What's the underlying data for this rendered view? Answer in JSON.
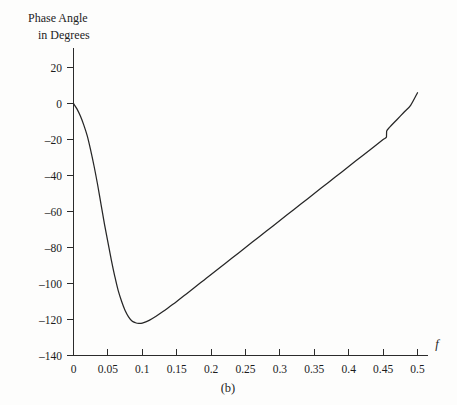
{
  "figure": {
    "caption": "(b)",
    "background_color": "#fdfdfc",
    "curve_color": "#262626",
    "axis_color": "#2b2b2b"
  },
  "axes": {
    "y_label_line1": "Phase Angle",
    "y_label_line2": "in Degrees",
    "x_label": "f",
    "x_ticks": [
      "0",
      "0.05",
      "0.1",
      "0.15",
      "0.2",
      "0.25",
      "0.3",
      "0.35",
      "0.4",
      "0.45",
      "0.5"
    ],
    "x_tick_values": [
      0,
      0.05,
      0.1,
      0.15,
      0.2,
      0.25,
      0.3,
      0.35,
      0.4,
      0.45,
      0.5
    ],
    "y_ticks": [
      "20",
      "0",
      "–20",
      "–40",
      "–60",
      "–80",
      "–100",
      "–120",
      "–140"
    ],
    "y_tick_values": [
      20,
      0,
      -20,
      -40,
      -60,
      -80,
      -100,
      -120,
      -140
    ]
  },
  "chart_data": {
    "type": "line",
    "title": "",
    "subtitle": "",
    "caption": "(b)",
    "xlabel": "f",
    "ylabel": "Phase Angle in Degrees",
    "xlim": [
      0,
      0.5
    ],
    "ylim": [
      -140,
      20
    ],
    "xticks": [
      0,
      0.05,
      0.1,
      0.15,
      0.2,
      0.25,
      0.3,
      0.35,
      0.4,
      0.45,
      0.5
    ],
    "yticks": [
      20,
      0,
      -20,
      -40,
      -60,
      -80,
      -100,
      -120,
      -140
    ],
    "grid": false,
    "legend": "none",
    "annotations": [
      "small discontinuity near f = 0.455"
    ],
    "series": [
      {
        "name": "Phase Angle",
        "color": "#262626",
        "x": [
          0,
          0.005,
          0.01,
          0.015,
          0.02,
          0.025,
          0.03,
          0.035,
          0.04,
          0.045,
          0.05,
          0.055,
          0.06,
          0.065,
          0.07,
          0.075,
          0.08,
          0.085,
          0.09,
          0.095,
          0.1,
          0.11,
          0.12,
          0.13,
          0.14,
          0.15,
          0.16,
          0.17,
          0.18,
          0.19,
          0.2,
          0.22,
          0.24,
          0.26,
          0.28,
          0.3,
          0.32,
          0.34,
          0.36,
          0.38,
          0.4,
          0.42,
          0.44,
          0.45,
          0.4549,
          0.4551,
          0.46,
          0.47,
          0.48,
          0.49,
          0.5
        ],
        "y": [
          0,
          -3,
          -7,
          -12,
          -18,
          -26,
          -35,
          -45,
          -56,
          -67,
          -77,
          -87,
          -96,
          -104,
          -110,
          -115,
          -118.5,
          -120.8,
          -121.8,
          -122.2,
          -122,
          -120.5,
          -118.2,
          -115.6,
          -112.8,
          -110,
          -107,
          -104,
          -101,
          -98,
          -95,
          -89,
          -83,
          -77,
          -71,
          -65,
          -59,
          -53,
          -47,
          -41,
          -35,
          -29,
          -23,
          -20,
          -18.6,
          -15.4,
          -13,
          -9,
          -5,
          -1,
          6
        ]
      }
    ]
  }
}
